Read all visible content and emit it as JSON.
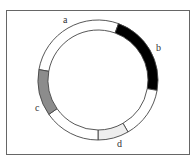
{
  "diagram": {
    "type": "segmented-ring",
    "center": [
      98,
      80
    ],
    "outer_radius": 60,
    "inner_radius": 50,
    "segments": [
      {
        "id": "a",
        "label": "a",
        "start_deg": 280,
        "end_deg": 20,
        "fill": "#ffffff"
      },
      {
        "id": "b",
        "label": "b",
        "start_deg": 20,
        "end_deg": 100,
        "fill": "#000000"
      },
      {
        "id": "unlabeled-1",
        "label": "",
        "start_deg": 100,
        "end_deg": 150,
        "fill": "#ffffff"
      },
      {
        "id": "d",
        "label": "d",
        "start_deg": 150,
        "end_deg": 180,
        "fill": "#eeeeee"
      },
      {
        "id": "unlabeled-2",
        "label": "",
        "start_deg": 180,
        "end_deg": 235,
        "fill": "#ffffff"
      },
      {
        "id": "c",
        "label": "c",
        "start_deg": 235,
        "end_deg": 280,
        "fill": "#8c8c8c"
      }
    ],
    "labels": {
      "a": "a",
      "b": "b",
      "c": "c",
      "d": "d"
    },
    "stroke_color": "#444444",
    "frame_color": "#666666"
  }
}
